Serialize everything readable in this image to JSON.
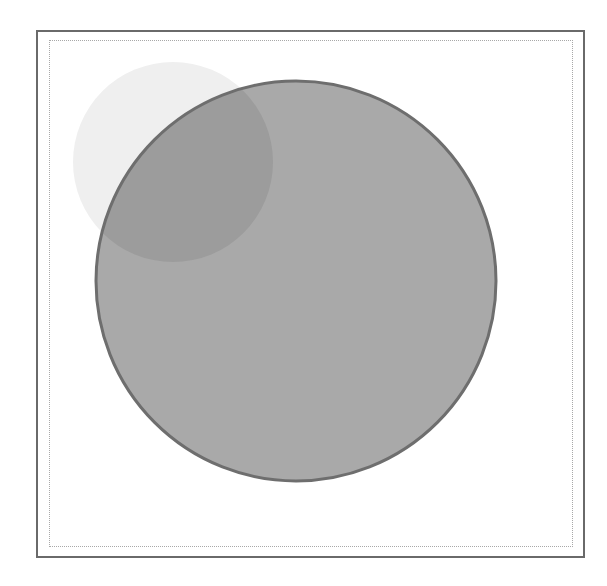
{
  "diagram": {
    "type": "overlapping-circles",
    "frame": {
      "outer_color": "#6a6a6a",
      "inner_color": "#a8a8a8"
    },
    "circles": [
      {
        "name": "small-circle",
        "cx": 173,
        "cy": 162,
        "r": 100,
        "fill": "#efefef",
        "stroke": "none"
      },
      {
        "name": "large-circle",
        "cx": 296,
        "cy": 281,
        "r": 200,
        "fill": "#a9a9a9",
        "stroke": "#6e6e6e"
      }
    ],
    "overlap": {
      "fill": "#9c9c9c"
    }
  }
}
